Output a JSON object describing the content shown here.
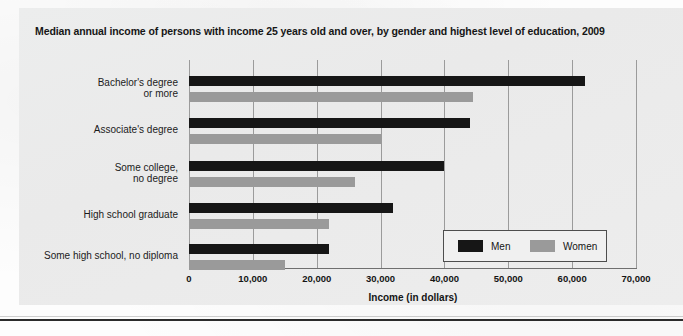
{
  "figure": {
    "title": "Median annual income of persons with income 25 years old and over, by gender and highest level of education, 2009"
  },
  "colors": {
    "men": "#161616",
    "women": "#9a9a9a",
    "panel_background": "#ececec",
    "gridline": "#9b9b9b",
    "axis": "#6f6f6f",
    "text": "#141414"
  },
  "legend": {
    "position": "inside-bottom-right",
    "items": [
      {
        "label": "Men",
        "color": "#161616",
        "swatch": "legend-swatch-men"
      },
      {
        "label": "Women",
        "color": "#9a9a9a",
        "swatch": "legend-swatch-women"
      }
    ]
  },
  "ghost_text": {
    "line1": "er place in Intro",
    "line2": "e change"
  },
  "chart_data": {
    "type": "bar",
    "orientation": "horizontal",
    "title": "Median annual income of persons with income 25 years old and over, by gender and highest level of education, 2009",
    "xlabel": "Income (in dollars)",
    "ylabel": "",
    "xlim": [
      0,
      70000
    ],
    "xticks": [
      0,
      10000,
      20000,
      30000,
      40000,
      50000,
      60000,
      70000
    ],
    "xtick_labels": [
      "0",
      "10,000",
      "20,000",
      "30,000",
      "40,000",
      "50,000",
      "60,000",
      "70,000"
    ],
    "grid": "vertical",
    "legend_position": "inside-bottom-right",
    "categories": [
      "Bachelor's degree\nor more",
      "Associate's degree",
      "Some college,\nno degree",
      "High school graduate",
      "Some high school, no diploma"
    ],
    "category_lines": [
      [
        "Bachelor's degree",
        "or more"
      ],
      [
        "Associate's degree"
      ],
      [
        "Some college,",
        "no degree"
      ],
      [
        "High school graduate"
      ],
      [
        "Some high school, no diploma"
      ]
    ],
    "series": [
      {
        "name": "Men",
        "color": "#161616",
        "values": [
          62000,
          44000,
          40000,
          32000,
          22000
        ]
      },
      {
        "name": "Women",
        "color": "#9a9a9a",
        "values": [
          44500,
          30000,
          26000,
          22000,
          15000
        ]
      }
    ]
  }
}
